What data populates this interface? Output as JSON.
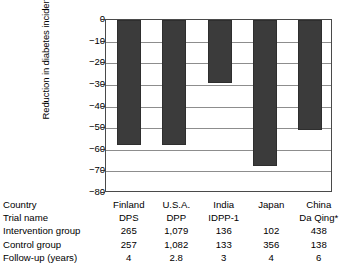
{
  "chart_data": {
    "type": "bar",
    "title": "",
    "xlabel": "",
    "ylabel": "Reduction in diabetes incidence (%)",
    "ylim": [
      -80,
      0
    ],
    "yticks": [
      "0",
      "−10",
      "−20",
      "−30",
      "−40",
      "−50",
      "−60",
      "−70",
      "−80"
    ],
    "ytick_values": [
      0,
      -10,
      -20,
      -30,
      -40,
      -50,
      -60,
      -70,
      -80
    ],
    "grid": true,
    "legend": "none",
    "categories": [
      "Finland",
      "U.S.A.",
      "India",
      "Japan",
      "China"
    ],
    "values": [
      -58,
      -58,
      -29,
      -67.4,
      -51
    ],
    "bar_color": "#3b3b3b",
    "frame_color": "#4a4a4a",
    "gridline_color": "#8d8d8d"
  },
  "table": {
    "rows": [
      {
        "label": "Country",
        "cells": [
          "Finland",
          "U.S.A.",
          "India",
          "Japan",
          "China"
        ]
      },
      {
        "label": "Trial name",
        "cells": [
          "DPS",
          "DPP",
          "IDPP-1",
          "",
          "Da Qing*"
        ]
      },
      {
        "label": "Intervention group",
        "cells": [
          "265",
          "1,079",
          "136",
          "102",
          "438"
        ]
      },
      {
        "label": "Control group",
        "cells": [
          "257",
          "1,082",
          "133",
          "356",
          "138"
        ]
      },
      {
        "label": "Follow-up (years)",
        "cells": [
          "4",
          "2.8",
          "3",
          "4",
          "6"
        ]
      }
    ]
  }
}
